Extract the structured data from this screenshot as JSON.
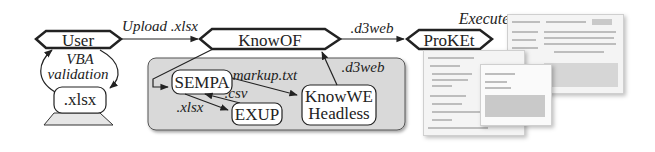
{
  "diagram": {
    "nodes": {
      "user": "User",
      "xlsx_local": ".xlsx",
      "knowof": "KnowOF",
      "proket": "ProKEt",
      "sempa": "SEMPA",
      "exup": "EXUP",
      "knowwe_line1": "KnowWE",
      "knowwe_line2": "Headless"
    },
    "edges": {
      "upload": "Upload .xlsx",
      "vba_line1": "VBA",
      "vba_line2": "validation",
      "d3web_out": ".d3web",
      "d3web_back": ".d3web",
      "markup": "markup.txt",
      "csv": ".csv",
      "xlsx_exup": ".xlsx",
      "execute": "Execute"
    },
    "colors": {
      "panel_fill": "#d9d9d9",
      "stroke": "#222222",
      "node_fill": "#ffffff"
    }
  }
}
